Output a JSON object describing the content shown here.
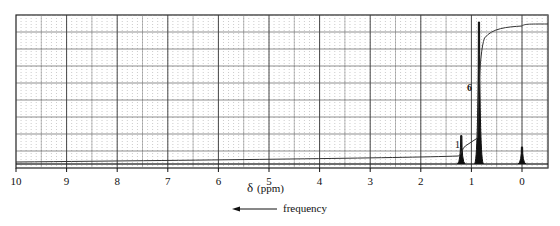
{
  "header_fragment": "...g ... p",
  "chart_data": {
    "type": "line",
    "title": "",
    "xlabel": "δ (ppm)",
    "ylabel": "",
    "xlim": [
      10,
      -0.5
    ],
    "x_direction": "reversed",
    "x_ticks": [
      10,
      9,
      8,
      7,
      6,
      5,
      4,
      3,
      2,
      1,
      0
    ],
    "grid": true,
    "annotation_arrow": "frequency",
    "series": [
      {
        "name": "1H NMR spectrum",
        "peaks": [
          {
            "ppm": 1.2,
            "relative_height": 0.2,
            "integration": 1
          },
          {
            "ppm": 0.85,
            "relative_height": 1.0,
            "integration": 6
          },
          {
            "ppm": 0.0,
            "relative_height": 0.12,
            "label": "TMS"
          }
        ]
      },
      {
        "name": "integration curve",
        "steps": [
          {
            "ppm": 1.2,
            "value": 1
          },
          {
            "ppm": 0.85,
            "value": 6
          }
        ]
      }
    ],
    "integration_labels": [
      "1",
      "6"
    ]
  },
  "axis": {
    "tick_labels": [
      "10",
      "9",
      "8",
      "7",
      "6",
      "5",
      "4",
      "3",
      "2",
      "1",
      "0"
    ],
    "xlabel_delta": "δ",
    "xlabel_unit": "(ppm)",
    "arrow_label": "frequency"
  },
  "annotations": {
    "integral_1": "1",
    "integral_6": "6"
  }
}
